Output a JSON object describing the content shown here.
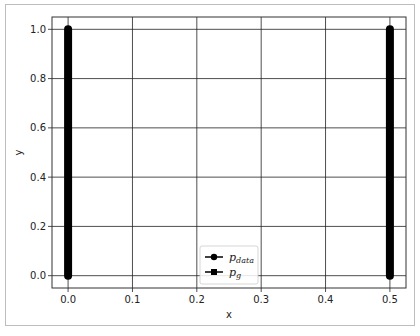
{
  "chart_data": {
    "type": "line",
    "title": "",
    "xlabel": "x",
    "ylabel": "y",
    "xlim": [
      -0.025,
      0.525
    ],
    "ylim": [
      -0.05,
      1.05
    ],
    "xticks": [
      0.0,
      0.1,
      0.2,
      0.3,
      0.4,
      0.5
    ],
    "xtick_labels": [
      "0.0",
      "0.1",
      "0.2",
      "0.3",
      "0.4",
      "0.5"
    ],
    "yticks": [
      0.0,
      0.2,
      0.4,
      0.6,
      0.8,
      1.0
    ],
    "ytick_labels": [
      "0.0",
      "0.2",
      "0.4",
      "0.6",
      "0.8",
      "1.0"
    ],
    "grid": true,
    "legend_position": "lower-center",
    "series": [
      {
        "name": "p_data",
        "label_main": "p",
        "label_sub": "data",
        "marker": "circle",
        "color": "#000000",
        "x": [
          0.0,
          0.0
        ],
        "y": [
          0.0,
          1.0
        ]
      },
      {
        "name": "p_g",
        "label_main": "p",
        "label_sub": "g",
        "marker": "square",
        "color": "#000000",
        "x": [
          0.5,
          0.5
        ],
        "y": [
          0.0,
          1.0
        ]
      }
    ]
  }
}
